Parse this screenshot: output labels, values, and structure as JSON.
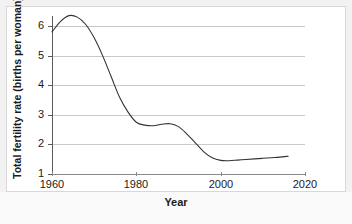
{
  "chart_data": {
    "type": "line",
    "title": "",
    "xlabel": "Year",
    "ylabel": "Total fertility rate (births per woman)",
    "xlim": [
      1960,
      2020
    ],
    "ylim": [
      1,
      6.6
    ],
    "xticks": [
      "1960",
      "1980",
      "2000",
      "2020"
    ],
    "yticks": [
      "1",
      "2",
      "3",
      "4",
      "5",
      "6"
    ],
    "grid": true,
    "legend": "none",
    "line_color": "#333333",
    "series": [
      {
        "name": "Total fertility rate",
        "x": [
          1960,
          1962,
          1964,
          1966,
          1968,
          1970,
          1972,
          1974,
          1976,
          1978,
          1980,
          1982,
          1984,
          1986,
          1988,
          1990,
          1992,
          1994,
          1996,
          1998,
          2000,
          2002,
          2004,
          2006,
          2008,
          2010,
          2012,
          2014,
          2016
        ],
        "values": [
          5.8,
          6.15,
          6.35,
          6.3,
          6.05,
          5.6,
          5.0,
          4.3,
          3.6,
          3.1,
          2.75,
          2.65,
          2.63,
          2.68,
          2.7,
          2.6,
          2.35,
          2.05,
          1.75,
          1.55,
          1.46,
          1.45,
          1.47,
          1.49,
          1.51,
          1.53,
          1.55,
          1.57,
          1.6
        ]
      }
    ],
    "annotations": []
  },
  "axes": {
    "xlabel": "Year",
    "ylabel": "Total fertility rate (births per woman)",
    "xticks": [
      {
        "label": "1960",
        "value": 1960
      },
      {
        "label": "1980",
        "value": 1980
      },
      {
        "label": "2000",
        "value": 2000
      },
      {
        "label": "2020",
        "value": 2020
      }
    ],
    "yticks": [
      {
        "label": "1",
        "value": 1
      },
      {
        "label": "2",
        "value": 2
      },
      {
        "label": "3",
        "value": 3
      },
      {
        "label": "4",
        "value": 4
      },
      {
        "label": "5",
        "value": 5
      },
      {
        "label": "6",
        "value": 6
      }
    ]
  }
}
